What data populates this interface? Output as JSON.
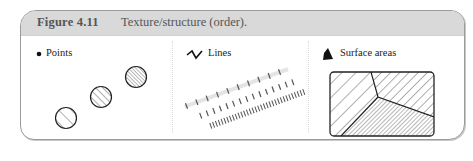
{
  "figure": {
    "number": "Figure 4.11",
    "title": "Texture/structure (order)."
  },
  "panels": [
    {
      "label": "Points",
      "icon": "dot-icon"
    },
    {
      "label": "Lines",
      "icon": "zigzag-icon"
    },
    {
      "label": "Surface areas",
      "icon": "filled-shape-icon"
    }
  ],
  "colors": {
    "header_bg": "#d9d9d9",
    "header_text": "#555555",
    "stroke": "#222222",
    "frame_border": "#9a9a9a"
  }
}
